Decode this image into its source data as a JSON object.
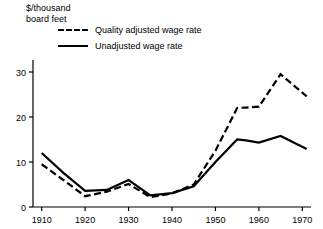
{
  "chart_data": {
    "type": "line",
    "title": "",
    "subtitle": "",
    "xlabel": "",
    "ylabel": "$/thousand\nboard feet",
    "ylabel_lines": [
      "$/thousand",
      "board feet"
    ],
    "xlim": [
      1908,
      1972
    ],
    "ylim": [
      0,
      35
    ],
    "grid": false,
    "legend_position": "top-left-inside",
    "xticks": [
      1910,
      1920,
      1930,
      1940,
      1950,
      1960,
      1970
    ],
    "xtick_labels": [
      "1910",
      "1920",
      "1930",
      "1940",
      "1950",
      "1960",
      "1970"
    ],
    "yticks": [
      0,
      10,
      20,
      30
    ],
    "ytick_labels": [
      "0",
      "10",
      "20",
      "30"
    ],
    "x": [
      1910,
      1915,
      1920,
      1925,
      1930,
      1935,
      1940,
      1945,
      1950,
      1955,
      1957,
      1960,
      1965,
      1971
    ],
    "series": [
      {
        "name": "Quality adjusted wage rate",
        "style": "dashed",
        "color": "#000000",
        "values": [
          9.5,
          6.0,
          2.4,
          3.4,
          5.1,
          2.2,
          3.0,
          5.0,
          12.5,
          22.0,
          22.1,
          22.3,
          29.5,
          24.6
        ]
      },
      {
        "name": "Unadjusted wage rate",
        "style": "solid",
        "color": "#000000",
        "values": [
          12.0,
          7.6,
          3.6,
          3.8,
          6.0,
          2.6,
          3.1,
          4.6,
          10.0,
          15.0,
          14.8,
          14.3,
          15.8,
          12.9
        ]
      }
    ]
  },
  "legend": {
    "items": [
      {
        "label": "Quality adjusted wage rate",
        "style": "dashed"
      },
      {
        "label": "Unadjusted wage rate",
        "style": "solid"
      }
    ]
  },
  "axes": {
    "y_title_line1": "$/thousand",
    "y_title_line2": "board feet"
  }
}
